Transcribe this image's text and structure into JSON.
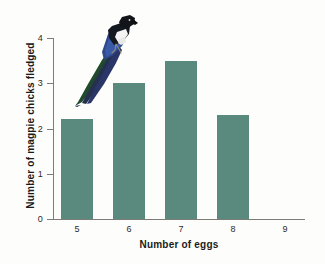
{
  "chart_data": {
    "type": "bar",
    "title": "",
    "xlabel": "Number of eggs",
    "ylabel": "Number of magpie chicks fledged",
    "categories": [
      "5",
      "6",
      "7",
      "8",
      "9"
    ],
    "values": [
      2.2,
      3.0,
      3.5,
      2.3,
      0
    ],
    "xlim": [
      "5",
      "9"
    ],
    "ylim": [
      0,
      4
    ],
    "yticks": [
      "0",
      "1",
      "2",
      "3",
      "4"
    ],
    "xticks": [
      "5",
      "6",
      "7",
      "8",
      "9"
    ],
    "grid": false,
    "legend": null,
    "bar_color": "#5a8a7d",
    "axis_color": "#7d7d78",
    "background_color": "#fdfdfb",
    "annotations": [
      {
        "name": "magpie-illustration",
        "description": "Photograph of a perched magpie with long iridescent tail",
        "colors": [
          "#111418",
          "#ffffff",
          "#2f4a8c",
          "#1f4a2e"
        ]
      }
    ]
  },
  "axes": {
    "y_tick_labels": [
      "0",
      "1",
      "2",
      "3",
      "4"
    ],
    "x_tick_labels": [
      "5",
      "6",
      "7",
      "8",
      "9"
    ],
    "x_title": "Number of eggs",
    "y_title": "Number of magpie chicks fledged"
  }
}
